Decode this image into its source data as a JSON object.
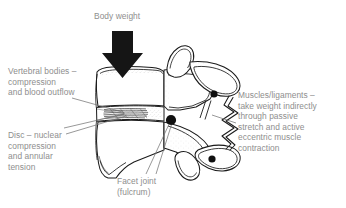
{
  "figure": {
    "background_color": "#ffffff",
    "text_color": "#8e8e8e",
    "line_color": "#1a1a1a",
    "width": 346,
    "height": 208
  },
  "labels": {
    "body_weight": "Body weight",
    "vertebral_bodies": "Vertebral bodies –\ncompression\nand blood outflow",
    "disc": "Disc – nuclear\ncompression\nand annular\ntension",
    "muscles": "Muscles/ligaments –\ntake weight indirectly\nthrough passive\nstretch and active\neccentric muscle\ncontraction",
    "facet_joint": "Facet joint\n(fulcrum)"
  },
  "icons": {
    "load_arrow": "down-arrow-icon",
    "fulcrum_marker": "fulcrum-dot-icon",
    "process_marker_upper": "process-dot-icon",
    "process_marker_lower": "process-dot-icon"
  },
  "anatomy": {
    "vertebra_body": "vertebral-body-outline",
    "intervertebral_disc": "intervertebral-disc",
    "disc_annulus_fibers": "annular-fiber-hatching",
    "spinous_process": "spinous-process",
    "facet_joints": "facet-joint-pair",
    "muscle_zigzag": "muscle-ligament-zigzag"
  }
}
